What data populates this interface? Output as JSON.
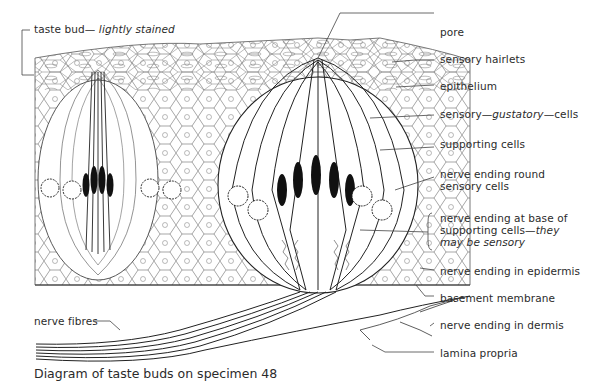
{
  "figure": {
    "caption": "Diagram of taste buds on specimen 48",
    "subject": "taste buds"
  },
  "labels": {
    "taste_bud": {
      "main": "taste bud— ",
      "italic": "lightly stained"
    },
    "pore": "pore",
    "sensory_hairlets": "sensory hairlets",
    "epithelium": "epithelium",
    "sensory_cells": {
      "pre": "sensory—",
      "italic": "gustatory",
      "post": "—cells"
    },
    "supporting_cells": "supporting cells",
    "nerve_ending_round": {
      "line1": "nerve ending round",
      "line2": "sensory cells"
    },
    "nerve_ending_base": {
      "line1": "nerve ending at base of",
      "line2_pre": "supporting cells—",
      "line2_italic": "they",
      "line3_italic": "may be sensory"
    },
    "nerve_ending_epidermis": "nerve ending in epidermis",
    "basement_membrane": "basement membrane",
    "nerve_ending_dermis": "nerve ending in dermis",
    "lamina_propria": "lamina propria",
    "nerve_fibres": "nerve fibres"
  },
  "colors": {
    "ink": "#2b2b2b",
    "nucleus": "#111111",
    "background": "#ffffff"
  }
}
